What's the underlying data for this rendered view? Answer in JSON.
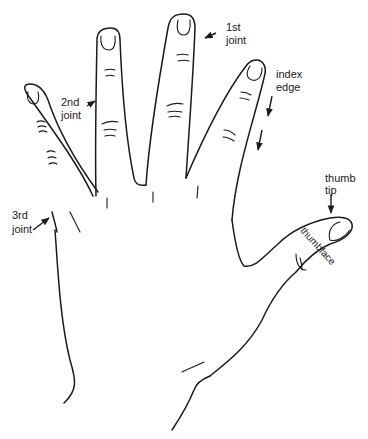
{
  "figure": {
    "labels": {
      "first_joint": [
        "1st",
        "joint"
      ],
      "second_joint": [
        "2nd",
        "joint"
      ],
      "third_joint": [
        "3rd",
        "joint"
      ],
      "index_edge": [
        "index",
        "edge"
      ],
      "thumb_tip": [
        "thumb",
        "tip"
      ],
      "thumbface": "thumbface"
    },
    "colors": {
      "ink": "#1a1a1a",
      "background": "#ffffff"
    }
  }
}
